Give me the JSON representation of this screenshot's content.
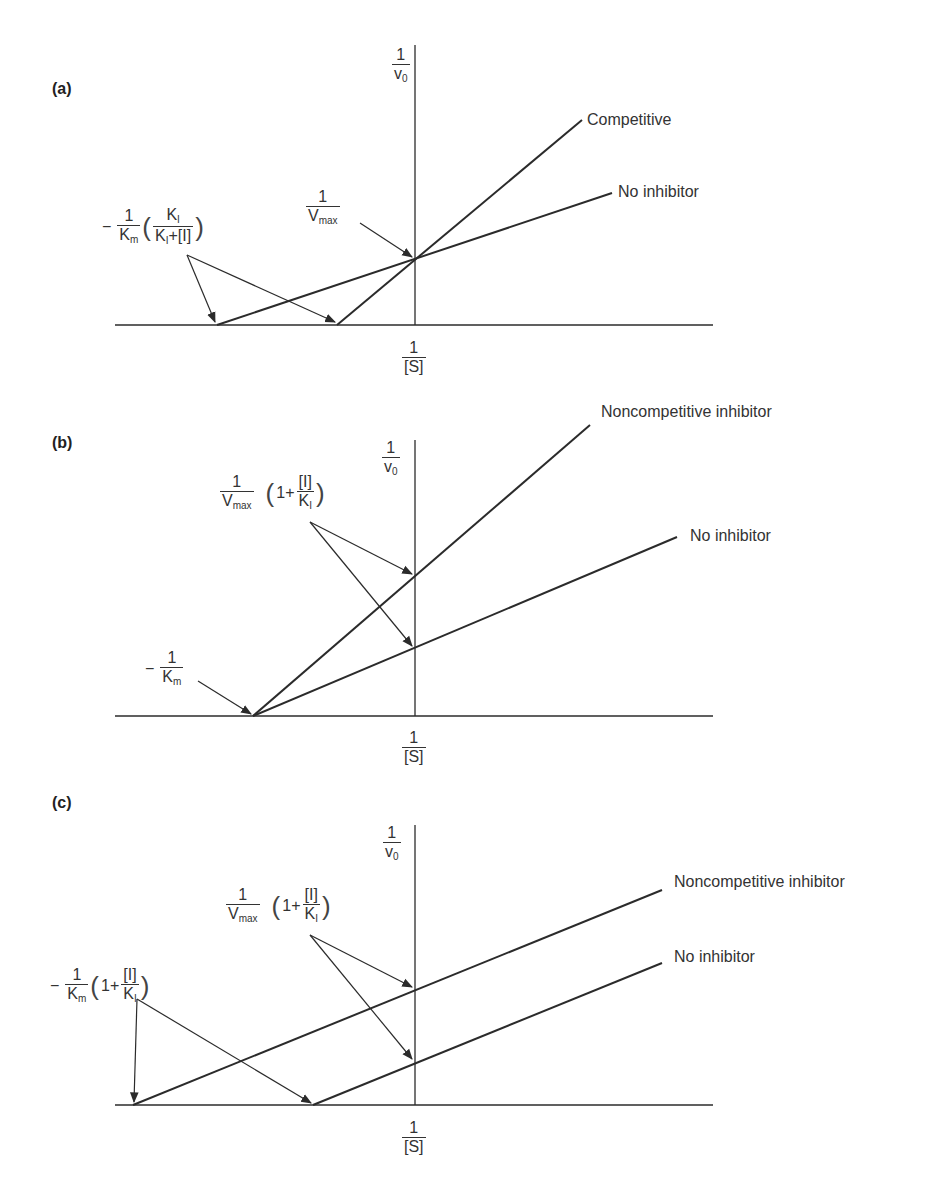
{
  "panels": [
    {
      "id": "a",
      "tag": "(a)",
      "y_axis_label": {
        "num": "1",
        "den": "v",
        "den_sub": "0"
      },
      "x_axis_label": {
        "num": "1",
        "den": "[S]"
      },
      "lines": [
        {
          "label": "Competitive",
          "from": [
            337,
            325
          ],
          "to": [
            582,
            120
          ]
        },
        {
          "label": "No inhibitor",
          "from": [
            217,
            325
          ],
          "to": [
            612,
            193
          ]
        }
      ],
      "annotations": {
        "y_intercept": {
          "num": "1",
          "den": "V",
          "den_sub": "max"
        },
        "x_intercept": {
          "prefix": "−",
          "num": "1",
          "den": "K",
          "den_sub": "m",
          "inner_num": "K",
          "inner_num_sub": "I",
          "inner_den": "K",
          "inner_den_sub": "I",
          "inner_den_tail": "+[I]"
        }
      }
    },
    {
      "id": "b",
      "tag": "(b)",
      "y_axis_label": {
        "num": "1",
        "den": "v",
        "den_sub": "0"
      },
      "x_axis_label": {
        "num": "1",
        "den": "[S]"
      },
      "lines": [
        {
          "label": "Noncompetitive inhibitor",
          "from": [
            253,
            716
          ],
          "to": [
            590,
            425
          ]
        },
        {
          "label": "No inhibitor",
          "from": [
            253,
            716
          ],
          "to": [
            677,
            537
          ]
        }
      ],
      "annotations": {
        "y_intercept": {
          "num": "1",
          "den": "V",
          "den_sub": "max",
          "factor_prefix": "1+",
          "factor_num": "[I]",
          "factor_den": "K",
          "factor_den_sub": "I"
        },
        "x_intercept": {
          "prefix": "−",
          "num": "1",
          "den": "K",
          "den_sub": "m"
        }
      }
    },
    {
      "id": "c",
      "tag": "(c)",
      "y_axis_label": {
        "num": "1",
        "den": "v",
        "den_sub": "0"
      },
      "x_axis_label": {
        "num": "1",
        "den": "[S]"
      },
      "lines": [
        {
          "label": "Noncompetitive inhibitor",
          "from": [
            133,
            1105
          ],
          "to": [
            662,
            890
          ]
        },
        {
          "label": "No inhibitor",
          "from": [
            313,
            1105
          ],
          "to": [
            662,
            963
          ]
        }
      ],
      "annotations": {
        "y_intercept": {
          "num": "1",
          "den": "V",
          "den_sub": "max",
          "factor_prefix": "1+",
          "factor_num": "[I]",
          "factor_den": "K",
          "factor_den_sub": "I"
        },
        "x_intercept": {
          "prefix": "−",
          "num": "1",
          "den": "K",
          "den_sub": "m",
          "factor_prefix": "1+",
          "factor_num": "[I]",
          "factor_den": "K",
          "factor_den_sub": "I"
        }
      }
    }
  ],
  "colors": {
    "ink": "#2b2b2b",
    "background": "#ffffff"
  }
}
